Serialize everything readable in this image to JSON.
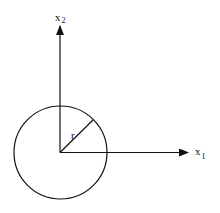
{
  "diagram": {
    "type": "geometric-figure",
    "axes": {
      "x1": {
        "label": "x",
        "subscript": "1"
      },
      "x2": {
        "label": "x",
        "subscript": "2"
      }
    },
    "circle": {
      "radius_label": "r"
    },
    "colors": {
      "stroke": "#111111",
      "background": "#ffffff"
    }
  }
}
